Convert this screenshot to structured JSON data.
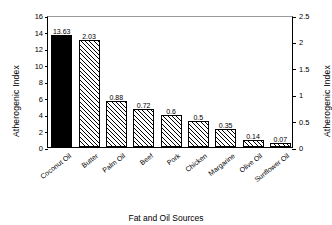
{
  "chart_data": {
    "type": "bar",
    "title": "",
    "xlabel": "Fat and Oil Sources",
    "ylabel": "Atherogenic Index",
    "ylabel_right": "Atherogenic Index",
    "categories": [
      "Coconut Oil",
      "Butter",
      "Palm Oil",
      "Beef",
      "Pork",
      "Chicken",
      "Margarine",
      "Olive Oil",
      "Sunflower Oil"
    ],
    "values": [
      13.63,
      2.03,
      0.88,
      0.72,
      0.6,
      0.5,
      0.35,
      0.14,
      0.07
    ],
    "value_labels": [
      "13.63",
      "2.03",
      "0.88",
      "0.72",
      "0.6",
      "0.5",
      "0.35",
      "0.14",
      "0.07"
    ],
    "bar_styles": [
      "solid",
      "hatch",
      "hatch",
      "hatch",
      "hatch",
      "hatch",
      "hatch",
      "hatch",
      "hatch"
    ],
    "bar_axis": [
      "left",
      "right",
      "right",
      "right",
      "right",
      "right",
      "right",
      "right",
      "right"
    ],
    "ylim": [
      0,
      16
    ],
    "ylim_right": [
      0,
      2.5
    ],
    "yticks_left": [
      "0",
      "2",
      "4",
      "6",
      "8",
      "10",
      "12",
      "14",
      "16"
    ],
    "yticks_right": [
      "0",
      "0.5",
      "1",
      "1.5",
      "2",
      "2.5"
    ],
    "grid": false,
    "legend": "none"
  }
}
